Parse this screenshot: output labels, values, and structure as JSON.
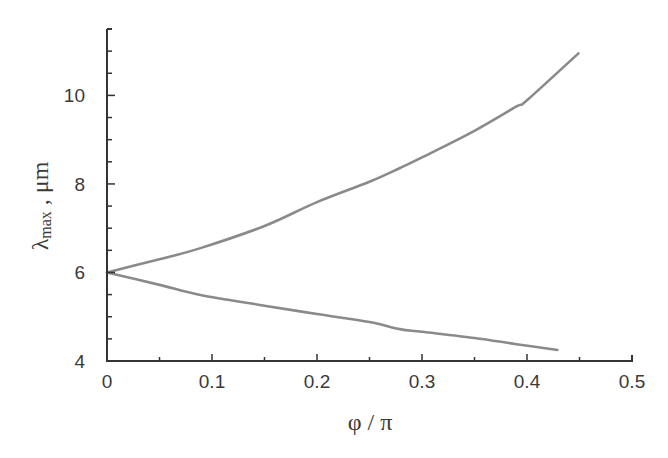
{
  "chart_data": {
    "type": "line",
    "title": "",
    "xlabel": "φ / π",
    "ylabel": "λmax , μm",
    "ylabel_parts": {
      "symbol": "λ",
      "subscript": "max",
      "suffix": " , μm"
    },
    "xlim": [
      0,
      0.5
    ],
    "ylim": [
      4,
      11.5
    ],
    "x_ticks": [
      0,
      0.1,
      0.2,
      0.3,
      0.4,
      0.5
    ],
    "x_tick_labels": [
      "0",
      "0.1",
      "0.2",
      "0.3",
      "0.4",
      "0.5"
    ],
    "x_minor_ticks": [
      0.05,
      0.15,
      0.25,
      0.35,
      0.45
    ],
    "y_ticks": [
      4,
      6,
      8,
      10
    ],
    "y_tick_labels": [
      "4",
      "6",
      "8",
      "10"
    ],
    "y_minor_ticks": [
      4.5,
      5,
      5.5,
      6.5,
      7,
      7.5,
      8.5,
      9,
      9.5,
      10.5,
      11
    ],
    "grid": false,
    "legend": null,
    "series": [
      {
        "name": "upper branch",
        "color": "#8a8a8a",
        "x": [
          0,
          0.05,
          0.089,
          0.15,
          0.2,
          0.25,
          0.279,
          0.3,
          0.35,
          0.39,
          0.4,
          0.449
        ],
        "y": [
          6.0,
          6.3,
          6.55,
          7.05,
          7.59,
          8.05,
          8.36,
          8.6,
          9.2,
          9.75,
          9.89,
          10.95
        ]
      },
      {
        "name": "lower branch",
        "color": "#8a8a8a",
        "x": [
          0,
          0.05,
          0.089,
          0.15,
          0.2,
          0.25,
          0.279,
          0.3,
          0.35,
          0.39,
          0.429
        ],
        "y": [
          6.0,
          5.72,
          5.49,
          5.25,
          5.06,
          4.88,
          4.72,
          4.66,
          4.52,
          4.38,
          4.25
        ]
      }
    ]
  },
  "colors": {
    "axis": "#333333",
    "curve": "#8a8a8a",
    "text": "#3a3a3a",
    "background": "#ffffff"
  }
}
